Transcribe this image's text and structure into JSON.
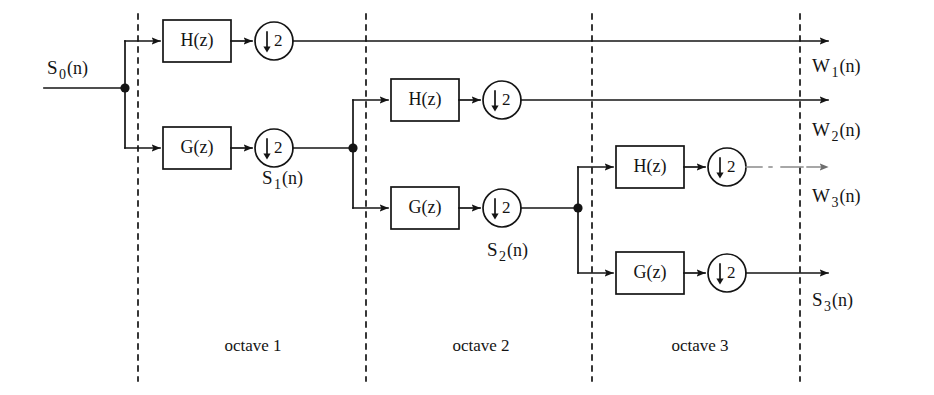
{
  "diagram": {
    "type": "block-diagram",
    "width": 934,
    "height": 395,
    "background_color": "#ffffff",
    "line_color": "#141414",
    "labels": {
      "analysis_filter_highpass": "H(z)",
      "analysis_filter_lowpass": "G(z)",
      "downsampler_arrow": "↓",
      "downsampler_factor": "2"
    },
    "inputs": [
      {
        "base": "S",
        "sub": "0",
        "tail": "(n)",
        "text": "S0(n)",
        "x": 47,
        "y": 58
      }
    ],
    "intermediate_signals": [
      {
        "base": "S",
        "sub": "1",
        "tail": "(n)",
        "text": "S1(n)",
        "x": 262,
        "y": 168
      },
      {
        "base": "S",
        "sub": "2",
        "tail": "(n)",
        "text": "S2(n)",
        "x": 487,
        "y": 240
      }
    ],
    "outputs": [
      {
        "base": "W",
        "sub": "1",
        "tail": "(n)",
        "text": "W1(n)",
        "x": 812,
        "y": 56
      },
      {
        "base": "W",
        "sub": "2",
        "tail": "(n)",
        "text": "W2(n)",
        "x": 812,
        "y": 120
      },
      {
        "base": "W",
        "sub": "3",
        "tail": "(n)",
        "text": "W3(n)",
        "x": 812,
        "y": 186
      },
      {
        "base": "S",
        "sub": "3",
        "tail": "(n)",
        "text": "S3(n)",
        "x": 812,
        "y": 290
      }
    ],
    "octaves": [
      {
        "label": "octave 1",
        "x": 253,
        "y": 345
      },
      {
        "label": "octave 2",
        "x": 481,
        "y": 345
      },
      {
        "label": "octave 3",
        "x": 700,
        "y": 345
      }
    ],
    "dividers": [
      {
        "name": "divider-1",
        "x": 138
      },
      {
        "name": "divider-2",
        "x": 366
      },
      {
        "name": "divider-3",
        "x": 592
      },
      {
        "name": "divider-4",
        "x": 800
      }
    ],
    "stages": [
      {
        "octave": 1,
        "highpass_box": "H(z)",
        "lowpass_box": "G(z)",
        "highpass_downsampler": "2",
        "lowpass_downsampler": "2"
      },
      {
        "octave": 2,
        "highpass_box": "H(z)",
        "lowpass_box": "G(z)",
        "highpass_downsampler": "2",
        "lowpass_downsampler": "2"
      },
      {
        "octave": 3,
        "highpass_box": "H(z)",
        "lowpass_box": "G(z)",
        "highpass_downsampler": "2",
        "lowpass_downsampler": "2"
      }
    ]
  }
}
